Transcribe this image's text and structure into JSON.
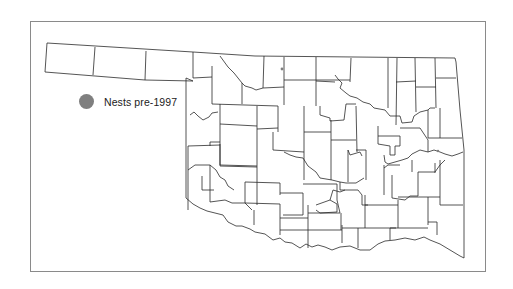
{
  "legend": {
    "items": [
      {
        "label": "Nests pre-1997",
        "symbol": "filled-circle",
        "color": "#7f7f7f"
      }
    ]
  },
  "map": {
    "region": "Oklahoma",
    "boundaries": "county outlines",
    "line_color": "#2a2a2a",
    "frame_color": "#8a8a8a",
    "points": [
      {
        "x": 282,
        "y": 69,
        "size": 2,
        "color": "#7f7f7f"
      },
      {
        "x": 438,
        "y": 151,
        "size": 2,
        "color": "#7f7f7f"
      }
    ]
  }
}
